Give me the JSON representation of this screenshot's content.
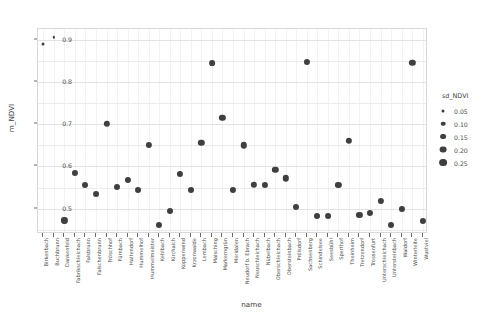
{
  "chart_data": {
    "type": "scatter",
    "title": "",
    "xlabel": "name",
    "ylabel": "m_NDVI",
    "ylim": [
      0.44,
      0.925
    ],
    "yticks": [
      0.5,
      0.6,
      0.7,
      0.8,
      0.9
    ],
    "ytick_labels": [
      "0.5",
      "0.6",
      "0.7",
      "0.8",
      "0.9"
    ],
    "grid": true,
    "legend": {
      "title": "sd_NDVI",
      "position": "right",
      "size_encoding": "sd_NDVI",
      "entries": [
        {
          "label": "0.05",
          "value": 0.05,
          "dot_px": 3.0
        },
        {
          "label": "0.10",
          "value": 0.1,
          "dot_px": 4.6
        },
        {
          "label": "0.15",
          "value": 0.15,
          "dot_px": 5.8
        },
        {
          "label": "0.20",
          "value": 0.2,
          "dot_px": 6.8
        },
        {
          "label": "0.25",
          "value": 0.25,
          "dot_px": 7.8
        }
      ]
    },
    "point_color": "#3f3f3f",
    "categories": [
      "Birkenbach",
      "Buchbrunn",
      "Dankenfeld",
      "Fabrikschleichach",
      "Falsbrunn",
      "Falschenbrunn",
      "Fröschhof",
      "Fürnbach",
      "Haltendorf",
      "Hummelhof",
      "Hummelmeister",
      "Kehlbach",
      "Kirchaich",
      "Koppenwind",
      "Krzonwalde",
      "Lembach",
      "Maisching",
      "Markerngrün",
      "Meridalen",
      "Neudorf b. Ebrach",
      "Neuschleichach",
      "Nübelbach",
      "Oberschleichach",
      "Obersteinbach",
      "Prölsdorf",
      "Sachsenberg",
      "Schindelsee",
      "Seesbühl",
      "Sperthof",
      "Theinheim",
      "Tretzendorf",
      "Trossenfurt",
      "Unterschleichach",
      "Untersteinbach",
      "Waldorf",
      "Winterleite",
      "Wustviel"
    ],
    "points": [
      {
        "name": "Birkenbach",
        "m_NDVI": 0.889,
        "sd_NDVI": 0.052
      },
      {
        "name": "Buchbrunn",
        "m_NDVI": 0.905,
        "sd_NDVI": 0.03
      },
      {
        "name": "Dankenfeld",
        "m_NDVI": 0.472,
        "sd_NDVI": 0.17
      },
      {
        "name": "Fabrikschleichach",
        "m_NDVI": 0.584,
        "sd_NDVI": 0.165
      },
      {
        "name": "Falsbrunn",
        "m_NDVI": 0.556,
        "sd_NDVI": 0.16
      },
      {
        "name": "Falschenbrunn",
        "m_NDVI": 0.535,
        "sd_NDVI": 0.155
      },
      {
        "name": "Fröschhof",
        "m_NDVI": 0.7,
        "sd_NDVI": 0.175
      },
      {
        "name": "Fürnbach",
        "m_NDVI": 0.552,
        "sd_NDVI": 0.162
      },
      {
        "name": "Haltendorf",
        "m_NDVI": 0.568,
        "sd_NDVI": 0.168
      },
      {
        "name": "Hummelhof",
        "m_NDVI": 0.545,
        "sd_NDVI": 0.158
      },
      {
        "name": "Hummelmeister",
        "m_NDVI": 0.65,
        "sd_NDVI": 0.172
      },
      {
        "name": "Kehlbach",
        "m_NDVI": 0.462,
        "sd_NDVI": 0.165
      },
      {
        "name": "Kirchaich",
        "m_NDVI": 0.494,
        "sd_NDVI": 0.158
      },
      {
        "name": "Koppenwind",
        "m_NDVI": 0.583,
        "sd_NDVI": 0.17
      },
      {
        "name": "Krzonwalde",
        "m_NDVI": 0.545,
        "sd_NDVI": 0.16
      },
      {
        "name": "Lembach",
        "m_NDVI": 0.655,
        "sd_NDVI": 0.178
      },
      {
        "name": "Maisching",
        "m_NDVI": 0.845,
        "sd_NDVI": 0.15
      },
      {
        "name": "Markerngrün",
        "m_NDVI": 0.714,
        "sd_NDVI": 0.175
      },
      {
        "name": "Meridalen",
        "m_NDVI": 0.545,
        "sd_NDVI": 0.168
      },
      {
        "name": "Neudorf b. Ebrach",
        "m_NDVI": 0.65,
        "sd_NDVI": 0.18
      },
      {
        "name": "Neuschleichach",
        "m_NDVI": 0.556,
        "sd_NDVI": 0.176
      },
      {
        "name": "Nübelbach",
        "m_NDVI": 0.556,
        "sd_NDVI": 0.166
      },
      {
        "name": "Oberschleichach",
        "m_NDVI": 0.592,
        "sd_NDVI": 0.178
      },
      {
        "name": "Obersteinbach",
        "m_NDVI": 0.572,
        "sd_NDVI": 0.18
      },
      {
        "name": "Prölsdorf",
        "m_NDVI": 0.505,
        "sd_NDVI": 0.16
      },
      {
        "name": "Sachsenberg",
        "m_NDVI": 0.848,
        "sd_NDVI": 0.165
      },
      {
        "name": "Schindelsee",
        "m_NDVI": 0.483,
        "sd_NDVI": 0.158
      },
      {
        "name": "Seesbühl",
        "m_NDVI": 0.483,
        "sd_NDVI": 0.155
      },
      {
        "name": "Sperthof",
        "m_NDVI": 0.556,
        "sd_NDVI": 0.172
      },
      {
        "name": "Theinheim",
        "m_NDVI": 0.66,
        "sd_NDVI": 0.176
      },
      {
        "name": "Tretzendorf",
        "m_NDVI": 0.486,
        "sd_NDVI": 0.17
      },
      {
        "name": "Trossenfurt",
        "m_NDVI": 0.489,
        "sd_NDVI": 0.166
      },
      {
        "name": "Unterschleichach",
        "m_NDVI": 0.518,
        "sd_NDVI": 0.172
      },
      {
        "name": "Untersteinbach",
        "m_NDVI": 0.462,
        "sd_NDVI": 0.162
      },
      {
        "name": "Waldorf",
        "m_NDVI": 0.5,
        "sd_NDVI": 0.166
      },
      {
        "name": "Winterleite",
        "m_NDVI": 0.845,
        "sd_NDVI": 0.176
      },
      {
        "name": "Wustviel",
        "m_NDVI": 0.47,
        "sd_NDVI": 0.168
      }
    ]
  }
}
